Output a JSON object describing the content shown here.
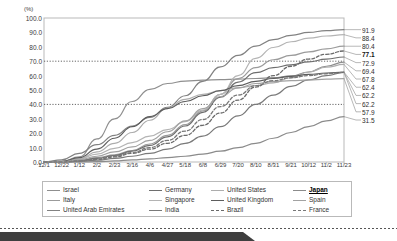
{
  "chart_data": {
    "type": "line",
    "title": "",
    "subtitle": "",
    "xlabel": "",
    "ylabel": "(%)",
    "unit_label": "(%)",
    "ylim": [
      0.0,
      100.0
    ],
    "ytick_values": [
      100.0,
      90.0,
      80.0,
      70.0,
      60.0,
      50.0,
      40.0,
      30.0,
      20.0,
      10.0,
      0.0
    ],
    "ytick_labels": [
      "100.0",
      "90.0",
      "80.0",
      "70.0",
      "60.0",
      "50.0",
      "40.0",
      "30.0",
      "20.0",
      "10.0",
      "0.0"
    ],
    "grid": "dotted-horizontal-at-70-and-40",
    "gridlines": [
      70.0,
      40.0
    ],
    "legend_position": "bottom",
    "categories": [
      "12/1",
      "12/22",
      "1/12",
      "2/2",
      "2/23",
      "3/16",
      "4/6",
      "4/27",
      "5/18",
      "6/8",
      "6/29",
      "7/20",
      "8/10",
      "8/31",
      "9/21",
      "10/12",
      "11/2",
      "11/23"
    ],
    "x": [
      "12/1",
      "12/22",
      "1/12",
      "2/2",
      "2/23",
      "3/16",
      "4/6",
      "4/27",
      "5/18",
      "6/8",
      "6/29",
      "7/20",
      "8/10",
      "8/31",
      "9/21",
      "10/12",
      "11/2",
      "11/23"
    ],
    "end_labels": [
      "91.9",
      "88.4",
      "80.4",
      "77.1",
      "72.9",
      "69.4",
      "67.8",
      "62.4",
      "62.2",
      "57.9",
      "31.5"
    ],
    "end_label_bold": "77.1",
    "series": [
      {
        "name": "Israel",
        "color": "#8f8f8f",
        "style": "solid",
        "end_value": 69.4,
        "values": [
          0.0,
          0.2,
          3.5,
          16.0,
          30.0,
          42.0,
          50.5,
          54.5,
          56.2,
          56.8,
          57.2,
          57.6,
          58.0,
          58.6,
          59.8,
          62.5,
          66.5,
          69.4
        ]
      },
      {
        "name": "Italy",
        "color": "#9b9b9b",
        "style": "solid",
        "end_value": 80.4,
        "values": [
          0.0,
          0.1,
          1.2,
          3.0,
          5.0,
          8.0,
          12.5,
          18.5,
          26.0,
          35.5,
          47.0,
          58.0,
          65.5,
          71.0,
          74.0,
          76.5,
          78.6,
          80.4
        ]
      },
      {
        "name": "United Arab Emirates",
        "color": "#828282",
        "style": "solid",
        "end_value": 91.9,
        "values": [
          0.0,
          1.5,
          6.0,
          12.0,
          18.5,
          25.0,
          31.0,
          38.0,
          46.0,
          56.0,
          66.0,
          74.0,
          80.5,
          85.0,
          88.0,
          90.0,
          91.2,
          91.9
        ]
      },
      {
        "name": "Germany",
        "color": "#6e6e6e",
        "style": "solid",
        "end_value": 72.9,
        "values": [
          0.0,
          0.1,
          1.0,
          2.5,
          4.5,
          7.5,
          11.5,
          17.5,
          25.0,
          34.5,
          45.0,
          55.5,
          62.0,
          65.5,
          67.5,
          69.5,
          71.5,
          72.9
        ]
      },
      {
        "name": "Singapore",
        "color": "#b4b4b4",
        "style": "solid",
        "end_value": 88.4,
        "values": [
          0.0,
          0.3,
          2.0,
          5.5,
          9.5,
          13.5,
          18.0,
          22.5,
          28.0,
          36.0,
          47.0,
          60.0,
          72.0,
          79.5,
          83.5,
          86.0,
          87.5,
          88.4
        ]
      },
      {
        "name": "India",
        "color": "#7a7a7a",
        "style": "solid",
        "end_value": 62.2,
        "values": [
          0.0,
          0.0,
          0.3,
          1.2,
          2.5,
          4.0,
          6.0,
          9.0,
          13.0,
          18.0,
          24.5,
          32.0,
          40.0,
          46.5,
          52.5,
          57.0,
          60.0,
          62.2
        ]
      },
      {
        "name": "United States",
        "color": "#adadad",
        "style": "solid",
        "end_value": 67.8,
        "values": [
          0.0,
          0.2,
          2.2,
          7.0,
          13.0,
          20.5,
          29.0,
          37.5,
          43.5,
          47.0,
          49.5,
          51.5,
          53.0,
          55.0,
          58.5,
          62.5,
          65.8,
          67.8
        ]
      },
      {
        "name": "United Kingdom",
        "color": "#5d5d5d",
        "style": "solid",
        "end_value": 62.4,
        "values": [
          0.0,
          0.5,
          3.0,
          9.0,
          16.5,
          24.5,
          31.5,
          37.0,
          42.0,
          46.0,
          49.5,
          53.0,
          56.0,
          58.0,
          59.5,
          60.8,
          61.8,
          62.4
        ]
      },
      {
        "name": "Brazil",
        "color": "#6a6a6a",
        "style": "dashed",
        "end_value": 77.1,
        "values": [
          0.0,
          0.0,
          0.5,
          1.8,
          3.5,
          6.0,
          9.0,
          13.0,
          18.5,
          25.5,
          34.0,
          43.0,
          52.0,
          60.0,
          66.5,
          71.5,
          74.8,
          77.1
        ]
      },
      {
        "name": "Japan",
        "color": "#8b8b8b",
        "style": "solid",
        "end_value": 31.5,
        "values": [
          0.0,
          0.0,
          0.0,
          0.2,
          0.8,
          1.5,
          2.2,
          3.0,
          4.0,
          5.5,
          7.5,
          10.0,
          13.0,
          16.5,
          20.5,
          24.5,
          28.5,
          31.5
        ]
      },
      {
        "name": "Spain",
        "color": "#a2a2a2",
        "style": "solid",
        "end_value": 57.9,
        "values": [
          0.0,
          0.2,
          1.5,
          4.0,
          7.0,
          10.5,
          15.0,
          21.0,
          28.5,
          37.0,
          45.5,
          51.5,
          54.5,
          55.8,
          56.5,
          57.0,
          57.5,
          57.9
        ]
      },
      {
        "name": "France",
        "color": "#787878",
        "style": "dashed",
        "end_value": 62.2,
        "values": [
          0.0,
          0.1,
          0.8,
          2.0,
          4.0,
          6.5,
          10.0,
          15.0,
          21.5,
          29.5,
          38.5,
          46.5,
          53.0,
          56.5,
          58.5,
          60.0,
          61.3,
          62.2
        ]
      }
    ]
  },
  "legend": {
    "items": [
      {
        "label": "Israel",
        "color": "#8f8f8f",
        "style": "solid",
        "bold": false
      },
      {
        "label": "Germany",
        "color": "#6e6e6e",
        "style": "solid",
        "bold": false
      },
      {
        "label": "United States",
        "color": "#adadad",
        "style": "solid",
        "bold": false
      },
      {
        "label": "Japan",
        "color": "#8b8b8b",
        "style": "solid",
        "bold": true
      },
      {
        "label": "Italy",
        "color": "#9b9b9b",
        "style": "solid",
        "bold": false
      },
      {
        "label": "Singapore",
        "color": "#b4b4b4",
        "style": "solid",
        "bold": false
      },
      {
        "label": "United Kingdom",
        "color": "#5d5d5d",
        "style": "solid",
        "bold": false
      },
      {
        "label": "Spain",
        "color": "#a2a2a2",
        "style": "solid",
        "bold": false
      },
      {
        "label": "United Arab Emirates",
        "color": "#828282",
        "style": "solid",
        "bold": false
      },
      {
        "label": "India",
        "color": "#7a7a7a",
        "style": "solid",
        "bold": false
      },
      {
        "label": "Brazil",
        "color": "#6a6a6a",
        "style": "dashed",
        "bold": false
      },
      {
        "label": "France",
        "color": "#787878",
        "style": "dashed",
        "bold": false
      }
    ]
  },
  "colors": {
    "axis": "#b9b9b9",
    "text": "#3b3b3b",
    "grid": "#555555",
    "tab": "#3f3f3f"
  }
}
